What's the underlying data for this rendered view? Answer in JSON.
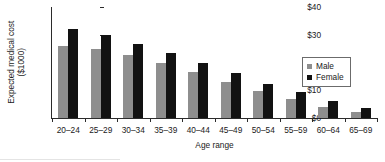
{
  "chart_data": {
    "type": "bar",
    "title": "",
    "xlabel": "Age range",
    "ylabel": "Expected medical cost ($1000)",
    "ylabel_line1": "Expected medical cost",
    "ylabel_line2": "($1000)",
    "categories": [
      "20–24",
      "25–29",
      "30–34",
      "35–39",
      "40–44",
      "45–49",
      "50–54",
      "55–59",
      "60–64",
      "65–69"
    ],
    "series": [
      {
        "name": "Male",
        "color": "#8e8e8e",
        "values": [
          26.0,
          25.0,
          22.8,
          19.8,
          16.5,
          13.0,
          9.7,
          6.7,
          4.1,
          2.1
        ]
      },
      {
        "name": "Female",
        "color": "#121212",
        "values": [
          32.2,
          30.0,
          26.8,
          23.4,
          19.8,
          16.1,
          12.4,
          9.2,
          6.2,
          3.5
        ]
      }
    ],
    "ylim": [
      0,
      40
    ],
    "yticks": [
      0,
      10,
      20,
      30,
      40
    ],
    "ytick_labels": [
      "$0",
      "$10",
      "$20",
      "$30",
      "$40"
    ],
    "grid": false,
    "legend_position": "right"
  },
  "legend": {
    "entries": [
      {
        "label": "Male",
        "swatch": "male"
      },
      {
        "label": "Female",
        "swatch": "female"
      }
    ]
  },
  "colors": {
    "male": "#8e8e8e",
    "female": "#121212",
    "axis": "#2b2b2b",
    "text": "#1a1a1a",
    "background": "#ffffff"
  }
}
